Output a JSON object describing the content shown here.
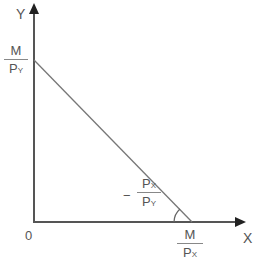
{
  "axes": {
    "y_label": "Y",
    "x_label": "X",
    "origin_label": "0"
  },
  "y_intercept": {
    "numerator": "M",
    "denominator_main": "P",
    "denominator_sub": "Y"
  },
  "x_intercept": {
    "numerator": "M",
    "denominator_main": "P",
    "denominator_sub": "X"
  },
  "slope": {
    "sign": "−",
    "numerator_main": "P",
    "numerator_sub": "X",
    "denominator_main": "P",
    "denominator_sub": "Y"
  },
  "colors": {
    "axis": "#555555",
    "line": "#777777",
    "text": "#555555"
  }
}
